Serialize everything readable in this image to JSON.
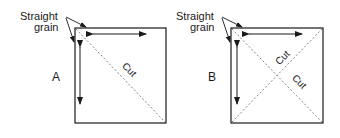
{
  "colors": {
    "stroke": "#1a1a1a",
    "dashed": "#777777",
    "background": "#ffffff"
  },
  "panels": [
    {
      "id": "A",
      "label": "A",
      "annotation_line1": "Straight",
      "annotation_line2": "grain",
      "cuts": [
        "Cut"
      ]
    },
    {
      "id": "B",
      "label": "B",
      "annotation_line1": "Straight",
      "annotation_line2": "grain",
      "cuts": [
        "Cut",
        "Cut"
      ]
    }
  ]
}
